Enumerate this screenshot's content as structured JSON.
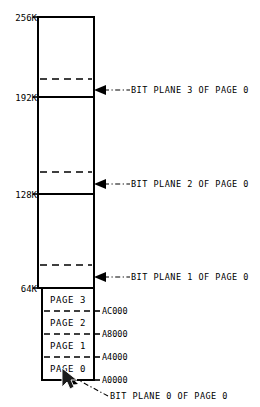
{
  "diagram": {
    "memory_scale_labels": [
      {
        "id": "256k",
        "text": "256K",
        "y": 17
      },
      {
        "id": "192k",
        "text": "192K",
        "y": 97
      },
      {
        "id": "128k",
        "text": "128K",
        "y": 194
      },
      {
        "id": "64k",
        "text": "64K",
        "y": 288
      }
    ],
    "bit_plane_callouts": [
      {
        "id": "plane3",
        "text": "BIT PLANE 3 OF PAGE 0",
        "y": 90
      },
      {
        "id": "plane2",
        "text": "BIT PLANE 2 OF PAGE 0",
        "y": 184
      },
      {
        "id": "plane1",
        "text": "BIT PLANE 1 OF PAGE 0",
        "y": 277
      },
      {
        "id": "plane0",
        "text": "BIT PLANE 0 OF PAGE 0",
        "y": 396
      }
    ],
    "pages": [
      {
        "id": "page3",
        "label": "PAGE 3",
        "address": "AC000",
        "top": 288,
        "bottom": 311
      },
      {
        "id": "page2",
        "label": "PAGE 2",
        "address": "A8000",
        "top": 311,
        "bottom": 334
      },
      {
        "id": "page1",
        "label": "PAGE 1",
        "address": "A4000",
        "top": 334,
        "bottom": 357
      },
      {
        "id": "page0",
        "label": "PAGE 0",
        "address": "A0000",
        "top": 357,
        "bottom": 380
      }
    ],
    "plane_dashed_rules": [
      {
        "id": "dash-plane3",
        "y": 79
      },
      {
        "id": "dash-plane2",
        "y": 172
      },
      {
        "id": "dash-plane1",
        "y": 265
      }
    ],
    "colors": {
      "ink": "#000000",
      "paper": "#ffffff",
      "cursor": "#1b1b1b"
    },
    "cursor": {
      "x": 62,
      "y": 369
    }
  }
}
